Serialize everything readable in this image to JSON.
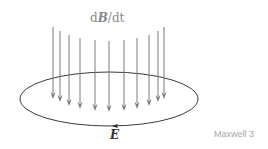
{
  "diagram": {
    "title": "Maxwell 3",
    "top_label": {
      "prefix": "d",
      "variable": "B",
      "suffix": "/dt"
    },
    "loop_label": "E",
    "colors": {
      "arrows": "#7a7a7a",
      "loop": "#3a3a3a",
      "label": "#8a8a8a",
      "caption": "#a8a8a8"
    },
    "arrows": [
      {
        "x": 53,
        "y1": 27,
        "y2": 99
      },
      {
        "x": 60,
        "y1": 31,
        "y2": 102
      },
      {
        "x": 69,
        "y1": 35,
        "y2": 106
      },
      {
        "x": 80,
        "y1": 38,
        "y2": 109
      },
      {
        "x": 95,
        "y1": 40,
        "y2": 111
      },
      {
        "x": 109,
        "y1": 41,
        "y2": 112
      },
      {
        "x": 124,
        "y1": 40,
        "y2": 111
      },
      {
        "x": 137,
        "y1": 38,
        "y2": 109
      },
      {
        "x": 149,
        "y1": 35,
        "y2": 106
      },
      {
        "x": 158,
        "y1": 31,
        "y2": 102
      },
      {
        "x": 164,
        "y1": 27,
        "y2": 99
      }
    ],
    "loop": {
      "cx": 109,
      "cy": 99,
      "rx": 89,
      "ry": 27
    },
    "loop_direction": "counterclockwise-front-leftward"
  }
}
